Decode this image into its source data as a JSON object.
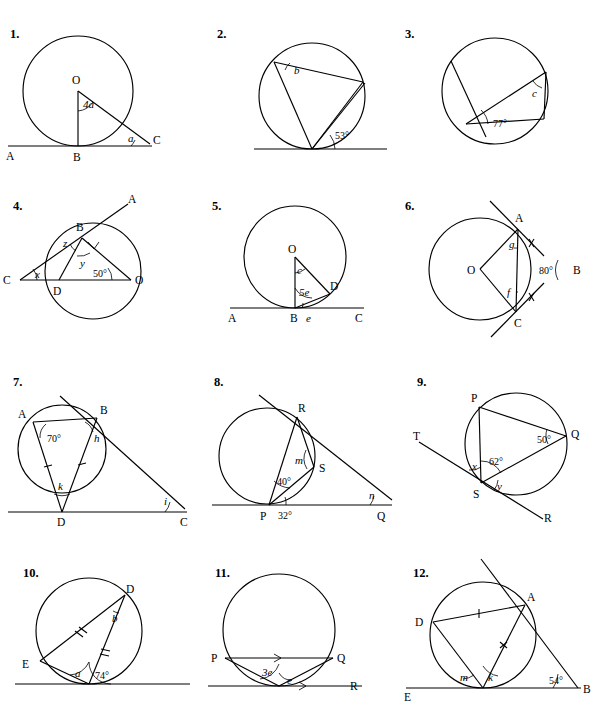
{
  "document": {
    "type": "geometry-worksheet",
    "subject": "Circle theorems - tangents, chords and angles",
    "layout": "4 rows x 3 columns of numbered diagrams"
  },
  "problems": [
    {
      "number": "1.",
      "points": [
        "O",
        "A",
        "B",
        "C"
      ],
      "angles": [
        "4a",
        "a"
      ],
      "description": "Circle centre O, tangent line AC touching at B, radius OB perpendicular to AC, line from O to C"
    },
    {
      "number": "2.",
      "points": [],
      "angles": [
        "b",
        "53°"
      ],
      "description": "Circle with tangent at bottom point, cyclic triangle, inscribed angle b and tangent-chord angle 53 degrees"
    },
    {
      "number": "3.",
      "points": [],
      "angles": [
        "c",
        "77°"
      ],
      "description": "Circle with tangent line, chord from tangent point, tangent-chord angle 77 degrees and inscribed angle c"
    },
    {
      "number": "4.",
      "points": [
        "A",
        "B",
        "C",
        "D",
        "O"
      ],
      "angles": [
        "x",
        "y",
        "z",
        "50°"
      ],
      "description": "Circle centre O, tangent CBA touching at B, right angle at B, line CDO through circle"
    },
    {
      "number": "5.",
      "points": [
        "O",
        "A",
        "B",
        "C",
        "D"
      ],
      "angles": [
        "c",
        "5e",
        "e"
      ],
      "description": "Circle centre O, tangent ABC at B, radius OB, chord BD, radius OD"
    },
    {
      "number": "6.",
      "points": [
        "O",
        "A",
        "B",
        "C"
      ],
      "angles": [
        "g",
        "f",
        "80°"
      ],
      "description": "Circle centre O, two tangents from B meeting at A and C, equal tangent marks, angle ABC = 80 degrees"
    },
    {
      "number": "7.",
      "points": [
        "A",
        "B",
        "C",
        "D"
      ],
      "angles": [
        "70°",
        "h",
        "k",
        "i"
      ],
      "description": "Circle with tangents at B and D meeting at C, isosceles triangle ABD, angle A = 70 degrees"
    },
    {
      "number": "8.",
      "points": [
        "P",
        "Q",
        "R",
        "S"
      ],
      "angles": [
        "m",
        "40°",
        "32°",
        "n"
      ],
      "description": "Circle with tangents at P and R meeting at Q, point S on circle, angles 40 and 32 degrees"
    },
    {
      "number": "9.",
      "points": [
        "P",
        "Q",
        "R",
        "S",
        "T"
      ],
      "angles": [
        "50°",
        "62°",
        "x",
        "y"
      ],
      "description": "Circle through P, Q, S with tangent TSR at S, angle PQS = 50 degrees, angle PSQ = 62 degrees"
    },
    {
      "number": "10.",
      "points": [
        "D",
        "E"
      ],
      "angles": [
        "a",
        "b",
        "74°"
      ],
      "description": "Circle with tangent at bottom point, chords to D and E with equal length marks, angle 74 degrees"
    },
    {
      "number": "11.",
      "points": [
        "P",
        "Q",
        "R"
      ],
      "angles": [
        "3e",
        "e"
      ],
      "description": "Circle with tangent at bottom point S, chord PQ parallel to tangent, angles 3e and e"
    },
    {
      "number": "12.",
      "points": [
        "A",
        "B",
        "D",
        "E"
      ],
      "angles": [
        "m",
        "k",
        "54°"
      ],
      "description": "Circle with tangent at A and tangent EB at bottom point, equal chord marks, angle 54 degrees"
    }
  ],
  "labels": {
    "p1": {
      "n": "1.",
      "O": "O",
      "A": "A",
      "B": "B",
      "C": "C",
      "ang4a": "4a",
      "anga": "a"
    },
    "p2": {
      "n": "2.",
      "b": "b",
      "a53": "53°"
    },
    "p3": {
      "n": "3.",
      "c": "c",
      "a77": "77°"
    },
    "p4": {
      "n": "4.",
      "A": "A",
      "B": "B",
      "C": "C",
      "D": "D",
      "O": "O",
      "x": "x",
      "y": "y",
      "z": "z",
      "a50": "50°"
    },
    "p5": {
      "n": "5.",
      "O": "O",
      "A": "A",
      "B": "B",
      "C": "C",
      "D": "D",
      "c": "c",
      "e5": "5e",
      "e": "e"
    },
    "p6": {
      "n": "6.",
      "O": "O",
      "A": "A",
      "B": "B",
      "C": "C",
      "g": "g",
      "f": "f",
      "a80": "80°"
    },
    "p7": {
      "n": "7.",
      "A": "A",
      "B": "B",
      "C": "C",
      "D": "D",
      "a70": "70°",
      "h": "h",
      "k": "k",
      "i": "i"
    },
    "p8": {
      "n": "8.",
      "P": "P",
      "Q": "Q",
      "R": "R",
      "S": "S",
      "m": "m",
      "a40": "40°",
      "a32": "32°",
      "n2": "n"
    },
    "p9": {
      "n": "9.",
      "P": "P",
      "Q": "Q",
      "R": "R",
      "S": "S",
      "T": "T",
      "a50": "50°",
      "a62": "62°",
      "x": "x",
      "y": "y"
    },
    "p10": {
      "n": "10.",
      "D": "D",
      "E": "E",
      "a": "a",
      "b": "b",
      "a74": "74°"
    },
    "p11": {
      "n": "11.",
      "P": "P",
      "Q": "Q",
      "R": "R",
      "e3": "3e",
      "e": "e"
    },
    "p12": {
      "n": "12.",
      "A": "A",
      "B": "B",
      "D": "D",
      "E": "E",
      "m": "m",
      "k": "k",
      "a54": "54°"
    }
  },
  "colors": {
    "ink": "#000000",
    "page": "#ffffff"
  }
}
